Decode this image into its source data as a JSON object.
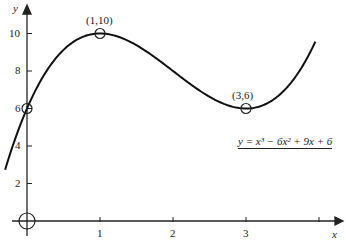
{
  "chart_data": {
    "type": "line",
    "title": "",
    "xlabel": "x",
    "ylabel": "y",
    "equation": "y = x³ − 6x² + 9x + 6",
    "x_ticks": [
      "1",
      "2",
      "3",
      ""
    ],
    "y_ticks": [
      "2",
      "4",
      "6",
      "8",
      "10"
    ],
    "xlim": [
      -0.3,
      4.2
    ],
    "ylim": [
      0,
      11
    ],
    "grid": false,
    "series": [
      {
        "name": "y = x^3 - 6x^2 + 9x + 6",
        "x": [
          -0.3,
          0,
          0.5,
          1,
          1.5,
          2,
          2.5,
          3,
          3.5,
          3.95
        ],
        "values": [
          2.73,
          6,
          9.13,
          10,
          9.38,
          8,
          6.63,
          6,
          6.88,
          9.6
        ]
      }
    ],
    "annotations": [
      {
        "label": "(1,10)",
        "x": 1,
        "y": 10
      },
      {
        "label": "(3,6)",
        "x": 3,
        "y": 6
      },
      {
        "label": "",
        "x": 0,
        "y": 6
      },
      {
        "label": "",
        "x": 0,
        "y": 0
      }
    ]
  }
}
